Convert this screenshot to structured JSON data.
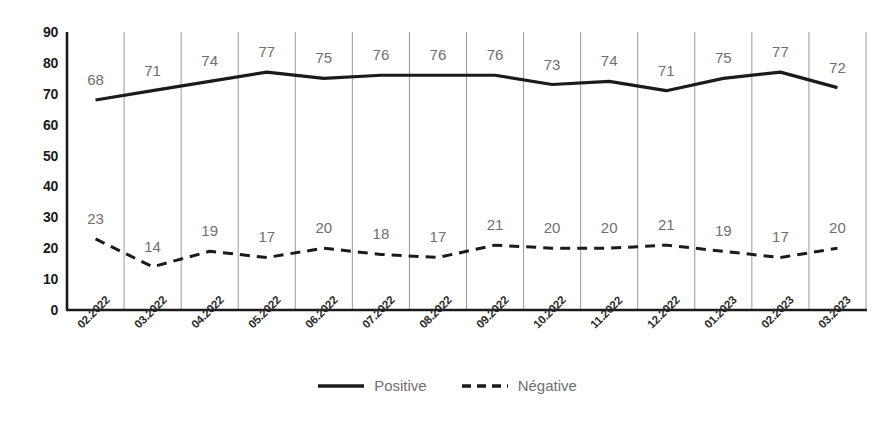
{
  "chart_data": {
    "type": "line",
    "title": "",
    "subtitle": "",
    "xlabel": "",
    "ylabel": "",
    "ylim": [
      0,
      90
    ],
    "yticks": [
      0,
      10,
      20,
      30,
      40,
      50,
      60,
      70,
      80,
      90
    ],
    "grid": "vertical",
    "legend_position": "bottom",
    "categories": [
      "02.2022",
      "03.2022",
      "04.2022",
      "05.2022",
      "06.2022",
      "07.2022",
      "08.2022",
      "09.2022",
      "10.2022",
      "11.2022",
      "12.2022",
      "01.2023",
      "02.2023",
      "03.2023"
    ],
    "series": [
      {
        "name": "Positive",
        "style": "solid",
        "color": "#1b1b1b",
        "values": [
          68,
          71,
          74,
          77,
          75,
          76,
          76,
          76,
          73,
          74,
          71,
          75,
          77,
          72
        ]
      },
      {
        "name": "Négative",
        "style": "dashed",
        "color": "#1b1b1b",
        "values": [
          23,
          14,
          19,
          17,
          20,
          18,
          17,
          21,
          20,
          20,
          21,
          19,
          17,
          20
        ]
      }
    ]
  },
  "legend": {
    "items": [
      {
        "label": "Positive",
        "style": "solid"
      },
      {
        "label": "Négative",
        "style": "dashed"
      }
    ]
  },
  "colors": {
    "line": "#1b1b1b",
    "grid": "#9a9a9a",
    "axis": "#1b1b1b",
    "data_label": "#6f6f6f",
    "tick_label": "#1b1b1b",
    "background": "#ffffff"
  }
}
